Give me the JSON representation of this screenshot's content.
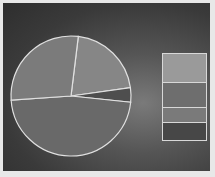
{
  "chart_data": {
    "type": "pie",
    "title": "",
    "slices": [
      {
        "label": "",
        "value": 21,
        "color": "#868686",
        "start_deg": 7,
        "end_deg": 82
      },
      {
        "label": "",
        "value": 4,
        "color": "#4e4e4e",
        "start_deg": 82,
        "end_deg": 96
      },
      {
        "label": "",
        "value": 47,
        "color": "#696969",
        "start_deg": 96,
        "end_deg": 266
      },
      {
        "label": "",
        "value": 28,
        "color": "#7b7b7b",
        "start_deg": 266,
        "end_deg": 367
      }
    ],
    "legend": {
      "position": "right",
      "entries": [
        {
          "label": "",
          "color": "#9a9a9a",
          "height": 28
        },
        {
          "label": "",
          "color": "#6e6e6e",
          "height": 24
        },
        {
          "label": "",
          "color": "#7a7a7a",
          "height": 14
        },
        {
          "label": "",
          "color": "#474747",
          "height": 17
        }
      ]
    },
    "geometry": {
      "cx": 71,
      "cy": 96,
      "r": 60
    }
  }
}
